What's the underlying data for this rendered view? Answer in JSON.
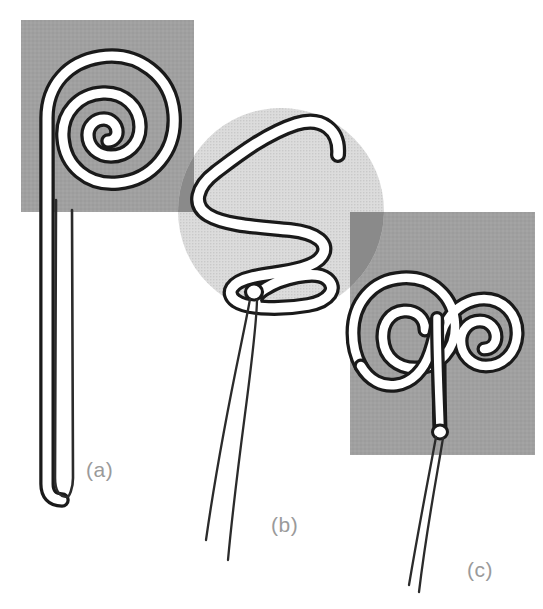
{
  "figure": {
    "width": 543,
    "height": 609,
    "background_color": "#ffffff",
    "filament_outline_color": "#1a1a1a",
    "filament_fill_color": "#ffffff",
    "thread_color": "#2b2b2b",
    "panels": [
      {
        "id": "a",
        "label": "(a)",
        "label_color": "#9a9a9a",
        "label_x": 86,
        "label_y": 458,
        "shape": "spiral-coil",
        "description": "Tight flat spiral of about 2.5 turns with a long straight doubled tail ending in a narrow hairpin loop",
        "backdrop": {
          "kind": "rectangle",
          "color": "#a0a0a0",
          "x": 21,
          "y": 20,
          "width": 173,
          "height": 192
        },
        "turns": 2.5,
        "tail_length_px": 290
      },
      {
        "id": "b",
        "label": "(b)",
        "label_color": "#9a9a9a",
        "label_x": 271,
        "label_y": 513,
        "shape": "serpentine-meander",
        "description": "S-shaped serpentine meander of about three switchbacks with two fine divergent threads trailing from the lower knot",
        "backdrop": {
          "kind": "circle",
          "color": "#d6d6d6",
          "cx": 281,
          "cy": 211,
          "r": 103
        },
        "switchbacks": 3,
        "thread_count": 2
      },
      {
        "id": "c",
        "label": "(c)",
        "label_color": "#9a9a9a",
        "label_x": 467,
        "label_y": 558,
        "shape": "double-spiral-ram-horn",
        "description": "Symmetric pair of opposing inward spirals joined at a central stem, with two fine threads trailing from the basal knot",
        "backdrop": {
          "kind": "rectangle",
          "color": "#a0a0a0",
          "x": 350,
          "y": 212,
          "width": 185,
          "height": 243
        },
        "turns_per_horn": 1.5,
        "thread_count": 2
      }
    ],
    "overlap_color": "#8a8a8a",
    "layer_order": [
      "rect-a",
      "circle-b",
      "rect-c",
      "filaments",
      "labels"
    ]
  }
}
